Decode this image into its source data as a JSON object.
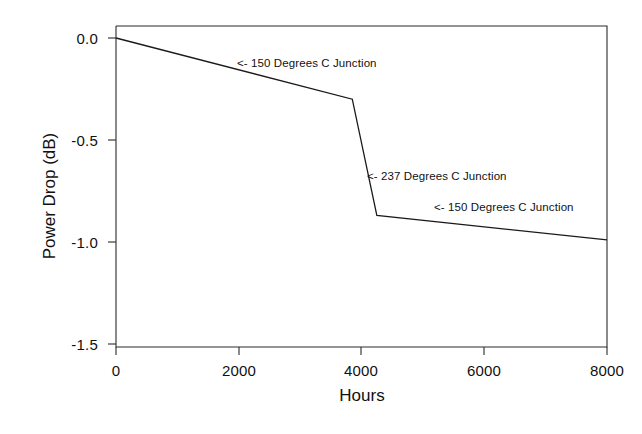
{
  "chart_data": {
    "type": "line",
    "title": "",
    "subtitle": "",
    "xlabel": "Hours",
    "ylabel": "Power Drop (dB)",
    "xlim": [
      0,
      8000
    ],
    "ylim": [
      -1.5,
      0.0
    ],
    "grid": false,
    "legend": "none",
    "xticks": [
      0,
      2000,
      4000,
      6000,
      8000
    ],
    "xtick_labels": [
      "0",
      "2000",
      "4000",
      "6000",
      "8000"
    ],
    "yticks": [
      0.0,
      -0.5,
      -1.0,
      -1.5
    ],
    "ytick_labels": [
      "0.0",
      "-0.5",
      "-1.0",
      "-1.5"
    ],
    "line_color": "#1a1a1a",
    "series": [
      {
        "name": "Power Drop",
        "x": [
          0,
          3850,
          4250,
          8000
        ],
        "y": [
          0.0,
          -0.3,
          -0.87,
          -0.99
        ]
      }
    ],
    "annotations": [
      {
        "text": "<- 150 Degrees C Junction",
        "x": 3600,
        "y": -0.155
      },
      {
        "text": "<- 237 Degrees C Junction",
        "x": 4300,
        "y": -0.68
      },
      {
        "text": "<- 150 Degrees C Junction",
        "x": 6050,
        "y": -0.825
      }
    ]
  }
}
